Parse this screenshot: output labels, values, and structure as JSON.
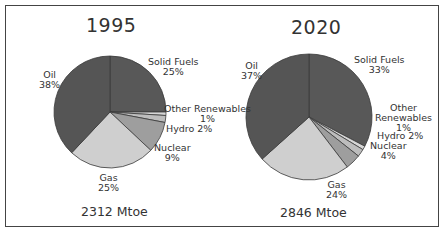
{
  "chart_data": [
    {
      "type": "pie",
      "title": "1995",
      "total_label": "2312 Mtoe",
      "categories": [
        "Solid Fuels",
        "Other Renewables",
        "Hydro",
        "Nuclear",
        "Gas",
        "Oil"
      ],
      "values": [
        25,
        1,
        2,
        9,
        25,
        38
      ],
      "labels": [
        "25%",
        "1%",
        "2%",
        "9%",
        "25%",
        "38%"
      ],
      "colors": [
        "#585858",
        "#d6d6d6",
        "#bdbdbd",
        "#9e9e9e",
        "#cfcfcf",
        "#555555"
      ]
    },
    {
      "type": "pie",
      "title": "2020",
      "total_label": "2846 Mtoe",
      "categories": [
        "Solid Fuels",
        "Other Renewables",
        "Hydro",
        "Nuclear",
        "Gas",
        "Oil"
      ],
      "values": [
        33,
        1,
        2,
        4,
        24,
        37
      ],
      "labels": [
        "33%",
        "1%",
        "2%",
        "4%",
        "24%",
        "37%"
      ],
      "colors": [
        "#585858",
        "#d6d6d6",
        "#bdbdbd",
        "#9e9e9e",
        "#cfcfcf",
        "#555555"
      ]
    }
  ],
  "pie1": {
    "title": "1995",
    "total": "2312 Mtoe",
    "solid_name": "Solid Fuels",
    "solid_pct": "25%",
    "other_name": "Other Renewables",
    "other_pct": "1%",
    "hydro": "Hydro  2%",
    "nuclear_name": "Nuclear",
    "nuclear_pct": "9%",
    "gas_name": "Gas",
    "gas_pct": "25%",
    "oil_name": "Oil",
    "oil_pct": "38%"
  },
  "pie2": {
    "title": "2020",
    "total": "2846 Mtoe",
    "solid_name": "Solid Fuels",
    "solid_pct": "33%",
    "other_name1": "Other",
    "other_name2": "Renewables",
    "other_pct": "1%",
    "hydro": "Hydro 2%",
    "nuclear_name": "Nuclear",
    "nuclear_pct": "4%",
    "gas_name": "Gas",
    "gas_pct": "24%",
    "oil_name": "Oil",
    "oil_pct": "37%"
  }
}
